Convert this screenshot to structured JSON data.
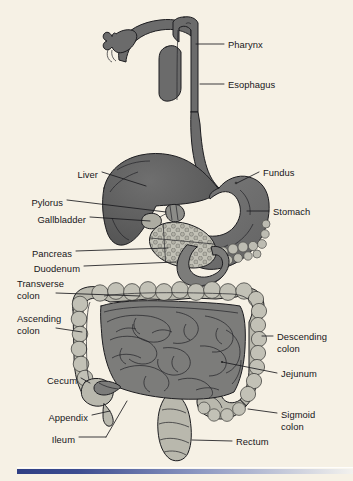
{
  "figure": {
    "background_color": "#f6f1e5",
    "width": 353,
    "height": 481
  },
  "colors": {
    "background": "#f6f1e5",
    "dark_organ": "#6b6b6b",
    "stomach": "#707070",
    "liver": "#5f5f5f",
    "small_intestine": "#7c7c7a",
    "colon": "#b9b8ad",
    "pancreas": "#bdbcb2",
    "outline": "#1d1d20",
    "label_text": "#16161a",
    "rule_blue": "#2f3f84"
  },
  "labels": {
    "left": [
      {
        "id": "liver",
        "text": "Liver",
        "x": 98,
        "y": 175,
        "line": [
          [
            102,
            172
          ],
          [
            146,
            186
          ]
        ]
      },
      {
        "id": "pylorus",
        "text": "Pylorus",
        "x": 63,
        "y": 203,
        "line": [
          [
            67,
            200
          ],
          [
            160,
            213
          ]
        ]
      },
      {
        "id": "gallbladder",
        "text": "Gallbladder",
        "x": 86,
        "y": 220,
        "line": [
          [
            90,
            217
          ],
          [
            150,
            220
          ]
        ]
      },
      {
        "id": "pancreas",
        "text": "Pancreas",
        "x": 72,
        "y": 254,
        "line": [
          [
            76,
            251
          ],
          [
            168,
            249
          ]
        ]
      },
      {
        "id": "duodenum",
        "text": "Duodenum",
        "x": 80,
        "y": 269,
        "line": [
          [
            84,
            266
          ],
          [
            172,
            262
          ]
        ]
      },
      {
        "id": "transverse-colon",
        "text": "Transverse",
        "x": 73,
        "y": 284,
        "line": null
      },
      {
        "id": "transverse-colon-2",
        "text": "colon",
        "x": 52,
        "y": 296,
        "line": [
          [
            56,
            293
          ],
          [
            140,
            297
          ]
        ]
      },
      {
        "id": "ascending-colon",
        "text": "Ascending",
        "x": 70,
        "y": 319,
        "line": null
      },
      {
        "id": "ascending-colon-2",
        "text": "colon",
        "x": 52,
        "y": 331,
        "line": [
          [
            56,
            328
          ],
          [
            82,
            333
          ]
        ]
      },
      {
        "id": "cecum",
        "text": "Cecum",
        "x": 77,
        "y": 381,
        "line": [
          [
            81,
            378
          ],
          [
            92,
            384
          ]
        ]
      },
      {
        "id": "appendix",
        "text": "Appendix",
        "x": 88,
        "y": 418,
        "line": [
          [
            92,
            415
          ],
          [
            112,
            410
          ]
        ]
      },
      {
        "id": "ileum",
        "text": "Ileum",
        "x": 75,
        "y": 440,
        "line": [
          [
            79,
            437
          ],
          [
            128,
            402
          ]
        ]
      }
    ],
    "right": [
      {
        "id": "pharynx",
        "text": "Pharynx",
        "x": 228,
        "y": 46,
        "line": [
          [
            196,
            44
          ],
          [
            224,
            44
          ]
        ]
      },
      {
        "id": "esophagus",
        "text": "Esophagus",
        "x": 228,
        "y": 86,
        "line": [
          [
            200,
            84
          ],
          [
            224,
            84
          ]
        ]
      },
      {
        "id": "fundus",
        "text": "Fundus",
        "x": 263,
        "y": 175,
        "line": [
          [
            236,
            182
          ],
          [
            259,
            173
          ]
        ]
      },
      {
        "id": "stomach",
        "text": "Stomach",
        "x": 273,
        "y": 213,
        "line": [
          [
            246,
            211
          ],
          [
            269,
            211
          ]
        ]
      },
      {
        "id": "descending-colon",
        "text": "Descending",
        "x": 277,
        "y": 338,
        "line": [
          [
            262,
            336
          ],
          [
            273,
            336
          ]
        ]
      },
      {
        "id": "descending-colon-2",
        "text": "colon",
        "x": 277,
        "y": 350,
        "line": null
      },
      {
        "id": "jejunum",
        "text": "Jejunum",
        "x": 281,
        "y": 375,
        "line": [
          [
            222,
            362
          ],
          [
            277,
            373
          ]
        ]
      },
      {
        "id": "sigmoid-colon",
        "text": "Sigmoid",
        "x": 281,
        "y": 416,
        "line": [
          [
            248,
            409
          ],
          [
            277,
            414
          ]
        ]
      },
      {
        "id": "sigmoid-colon-2",
        "text": "colon",
        "x": 281,
        "y": 428,
        "line": null
      },
      {
        "id": "rectum",
        "text": "Rectum",
        "x": 236,
        "y": 444,
        "line": [
          [
            196,
            441
          ],
          [
            232,
            442
          ]
        ]
      }
    ]
  }
}
